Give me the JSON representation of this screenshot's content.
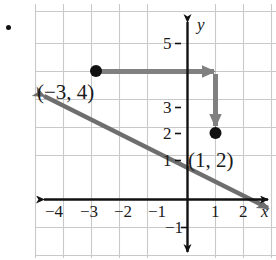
{
  "figure": {
    "type": "coordinate-plane-graph",
    "problem_bullet": "•",
    "axes": {
      "x_axis_label": "x",
      "y_axis_label": "y",
      "x_tick_labels": [
        "−4",
        "−3",
        "−2",
        "−1",
        "1",
        "2"
      ],
      "x_tick_values": [
        -4,
        -3,
        -2,
        -1,
        1,
        2
      ],
      "y_tick_labels": [
        "5",
        "3",
        "2",
        "1",
        "−1"
      ],
      "y_tick_values": [
        5,
        3,
        2,
        1,
        -1
      ],
      "grid": "on",
      "grid_color": "#c9c9c9",
      "axis_color": "#111111",
      "xlim": [
        -5.4,
        3.2
      ],
      "ylim": [
        -2.1,
        6.5
      ]
    },
    "line": {
      "color": "#6e6e6e",
      "slope": -0.5,
      "intercept": 2.5,
      "equation_points": [
        [
          -3,
          4
        ],
        [
          1,
          2
        ]
      ],
      "arrows": "both-ends"
    },
    "points": [
      {
        "label": "(−3, 4)",
        "x": -3,
        "y": 4,
        "color": "#111111"
      },
      {
        "label": "(1, 2)",
        "x": 1,
        "y": 2,
        "color": "#111111"
      }
    ],
    "slope_triangle": {
      "run_arrow": {
        "from": [
          -3,
          4
        ],
        "to": [
          1,
          4
        ],
        "direction": "right",
        "color": "#808080"
      },
      "rise_arrow": {
        "from": [
          1,
          4
        ],
        "to": [
          1,
          2
        ],
        "direction": "down",
        "color": "#808080"
      }
    },
    "colors": {
      "line": "#6e6e6e",
      "slope_arrow": "#808080",
      "grid": "#c9c9c9",
      "axis": "#111111",
      "text": "#1a1a1a",
      "background": "#ffffff"
    }
  }
}
